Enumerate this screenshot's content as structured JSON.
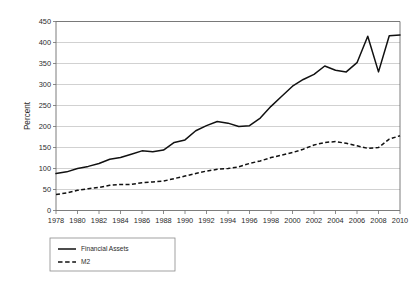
{
  "chart_data": {
    "type": "line",
    "title": "",
    "subtitle": "",
    "xlabel": "",
    "ylabel": "Percent",
    "xlim": [
      1978,
      2010
    ],
    "ylim": [
      0,
      450
    ],
    "ytick_step": 50,
    "xtick_step": 2,
    "grid": true,
    "legend_position": "below-left",
    "x": [
      1978,
      1979,
      1980,
      1981,
      1982,
      1983,
      1984,
      1985,
      1986,
      1987,
      1988,
      1989,
      1990,
      1991,
      1992,
      1993,
      1994,
      1995,
      1996,
      1997,
      1998,
      1999,
      2000,
      2001,
      2002,
      2003,
      2004,
      2005,
      2006,
      2007,
      2008,
      2009,
      2010
    ],
    "xticks": [
      "1978",
      "1980",
      "1982",
      "1984",
      "1986",
      "1988",
      "1990",
      "1992",
      "1994",
      "1996",
      "1998",
      "2000",
      "2002",
      "2004",
      "2006",
      "2008",
      "2010"
    ],
    "yticks": [
      "0",
      "50",
      "100",
      "150",
      "200",
      "250",
      "300",
      "350",
      "400",
      "450"
    ],
    "series": [
      {
        "name": "Financial Assets",
        "style": "solid",
        "color": "#111111",
        "values": [
          88,
          92,
          100,
          105,
          112,
          122,
          126,
          134,
          142,
          140,
          144,
          162,
          168,
          190,
          202,
          212,
          208,
          200,
          202,
          220,
          248,
          272,
          296,
          312,
          324,
          344,
          334,
          330,
          352,
          415,
          330,
          416,
          418
        ]
      },
      {
        "name": "M2",
        "style": "dashed",
        "color": "#111111",
        "values": [
          38,
          42,
          48,
          52,
          55,
          60,
          62,
          62,
          66,
          68,
          70,
          76,
          82,
          88,
          94,
          98,
          100,
          104,
          112,
          118,
          126,
          132,
          138,
          146,
          156,
          162,
          164,
          160,
          154,
          148,
          150,
          170,
          178
        ]
      }
    ]
  },
  "legend": {
    "items": [
      {
        "label": "Financial Assets",
        "style": "solid"
      },
      {
        "label": "M2",
        "style": "dashed"
      }
    ]
  }
}
